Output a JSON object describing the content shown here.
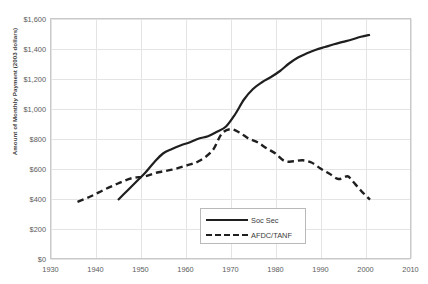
{
  "chart_data": {
    "type": "line",
    "title": "",
    "xlabel": "",
    "ylabel": "Amount of Monthly Payment (2003 dollars)",
    "xlim": [
      1930,
      2010
    ],
    "ylim": [
      0,
      1600
    ],
    "xticks": [
      1930,
      1940,
      1950,
      1960,
      1970,
      1980,
      1990,
      2000,
      2010
    ],
    "yticks": [
      0,
      200,
      400,
      600,
      800,
      1000,
      1200,
      1400,
      1600
    ],
    "ytick_labels": [
      "$0",
      "$200",
      "$400",
      "$600",
      "$800",
      "$1,000",
      "$1,200",
      "$1,400",
      "$1,600"
    ],
    "xtick_labels": [
      "1930",
      "1940",
      "1950",
      "1960",
      "1970",
      "1980",
      "1990",
      "2000",
      "2010"
    ],
    "grid": true,
    "legend_position": "lower-center",
    "series": [
      {
        "name": "Soc Sec",
        "style": "solid",
        "color": "#1f1f1f",
        "x": [
          1945,
          1947,
          1949,
          1951,
          1953,
          1955,
          1957,
          1959,
          1961,
          1963,
          1965,
          1967,
          1969,
          1971,
          1973,
          1975,
          1977,
          1979,
          1981,
          1983,
          1985,
          1987,
          1989,
          1991,
          1993,
          1995,
          1997,
          1999,
          2001
        ],
        "values": [
          390,
          450,
          510,
          570,
          640,
          700,
          730,
          755,
          775,
          800,
          815,
          845,
          880,
          960,
          1060,
          1130,
          1175,
          1210,
          1250,
          1300,
          1340,
          1368,
          1392,
          1410,
          1428,
          1444,
          1460,
          1478,
          1492
        ]
      },
      {
        "name": "AFDC/TANF",
        "style": "dashed",
        "color": "#1f1f1f",
        "x": [
          1936,
          1939,
          1942,
          1945,
          1948,
          1951,
          1954,
          1957,
          1960,
          1963,
          1966,
          1968,
          1970,
          1972,
          1974,
          1976,
          1978,
          1980,
          1982,
          1984,
          1986,
          1988,
          1990,
          1992,
          1994,
          1996,
          1997,
          1999,
          2001
        ],
        "values": [
          378,
          415,
          460,
          500,
          535,
          548,
          575,
          592,
          618,
          650,
          720,
          830,
          862,
          840,
          800,
          775,
          735,
          700,
          650,
          648,
          655,
          640,
          600,
          565,
          530,
          548,
          520,
          452,
          392
        ]
      }
    ]
  },
  "legend": {
    "items": [
      {
        "label": "Soc Sec",
        "style": "solid"
      },
      {
        "label": "AFDC/TANF",
        "style": "dashed"
      }
    ]
  }
}
